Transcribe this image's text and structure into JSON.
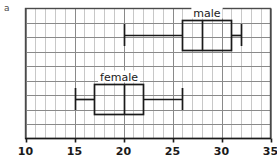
{
  "panel": {
    "label": "a"
  },
  "chart_data": {
    "type": "box",
    "title": "",
    "xlabel": "",
    "ylabel": "",
    "xlim": [
      10,
      35
    ],
    "xticks": [
      10,
      15,
      20,
      25,
      30,
      35
    ],
    "xtick_labels": [
      "10",
      "15",
      "20",
      "25",
      "30",
      "35"
    ],
    "grid": true,
    "grid_major_step": 5,
    "grid_minor_step": 1,
    "legend": "inline-labels",
    "series": [
      {
        "name": "male",
        "label": "male",
        "min": 20,
        "q1": 26,
        "median": 28,
        "q3": 31,
        "max": 32,
        "row": 1
      },
      {
        "name": "female",
        "label": "female",
        "min": 15,
        "q1": 17,
        "median": 20,
        "q3": 22,
        "max": 26,
        "row": 2
      }
    ],
    "colors": {
      "line": "#1a1a1a",
      "grid_major": "#8a8a8a",
      "grid_minor": "#c8c8c8",
      "frame": "#4a4a4a",
      "background": "#ffffff"
    }
  }
}
